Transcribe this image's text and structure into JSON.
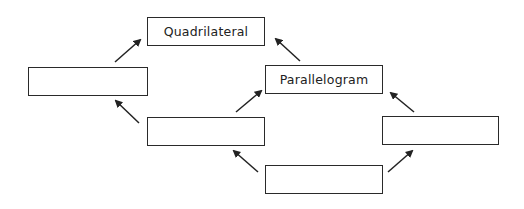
{
  "diagram": {
    "nodes": [
      {
        "id": "quadrilateral",
        "label": "Quadrilateral"
      },
      {
        "id": "left-blank",
        "label": ""
      },
      {
        "id": "parallelogram",
        "label": "Parallelogram"
      },
      {
        "id": "middle-blank",
        "label": ""
      },
      {
        "id": "right-blank",
        "label": ""
      },
      {
        "id": "bottom-blank",
        "label": ""
      }
    ],
    "edges": [
      {
        "from": "left-blank",
        "to": "quadrilateral"
      },
      {
        "from": "parallelogram",
        "to": "quadrilateral"
      },
      {
        "from": "middle-blank",
        "to": "left-blank"
      },
      {
        "from": "middle-blank",
        "to": "parallelogram"
      },
      {
        "from": "right-blank",
        "to": "parallelogram"
      },
      {
        "from": "bottom-blank",
        "to": "middle-blank"
      },
      {
        "from": "bottom-blank",
        "to": "right-blank"
      }
    ]
  }
}
